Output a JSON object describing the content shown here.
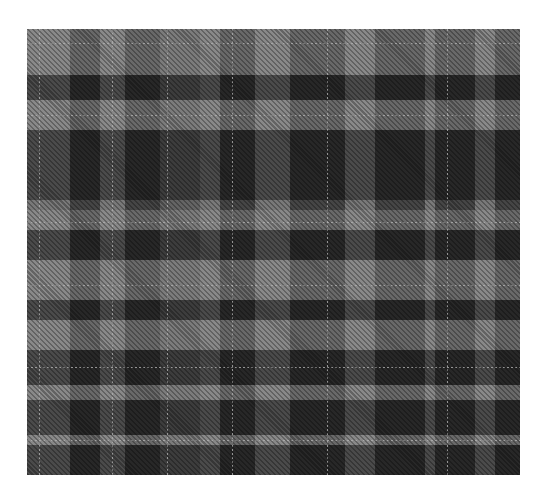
{
  "image": {
    "subject": "grayscale tartan plaid fabric swatch",
    "colors": {
      "background": "#ffffff",
      "base": "#5c5c5c",
      "light": "#969696",
      "dark": "#262626",
      "stripe": "#afafaf"
    }
  }
}
